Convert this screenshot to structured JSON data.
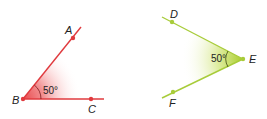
{
  "figures": [
    {
      "name": "angle-ABC",
      "vertex": "B",
      "points": [
        "A",
        "B",
        "C"
      ],
      "angle_label": "50°",
      "color": "#e03a3e",
      "fill": "#e8484c"
    },
    {
      "name": "angle-DEF",
      "vertex": "E",
      "points": [
        "D",
        "E",
        "F"
      ],
      "angle_label": "50°",
      "color": "#a8cc3a",
      "fill": "#b5d334"
    }
  ]
}
